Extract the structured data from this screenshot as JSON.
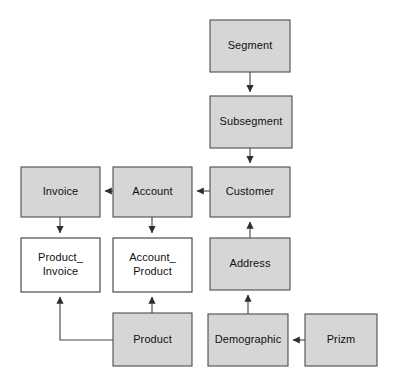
{
  "diagram": {
    "type": "er-diagram",
    "canvas": {
      "width": 400,
      "height": 388,
      "background": "#ffffff"
    },
    "styles": {
      "filled_fill": "#d6d6d6",
      "unfilled_fill": "#ffffff",
      "border_color": "#4d4d4d",
      "unfilled_border_color": "#3a3a3a",
      "edge_color": "#4a4a4a",
      "text_color": "#101010"
    },
    "nodes": [
      {
        "id": "segment",
        "label": "Segment",
        "lines": [
          "Segment"
        ],
        "x": 210,
        "y": 20,
        "w": 80,
        "h": 52,
        "fill": "filled"
      },
      {
        "id": "subsegment",
        "label": "Subsegment",
        "lines": [
          "Subsegment"
        ],
        "x": 210,
        "y": 96,
        "w": 82,
        "h": 52,
        "fill": "filled"
      },
      {
        "id": "customer",
        "label": "Customer",
        "lines": [
          "Customer"
        ],
        "x": 210,
        "y": 167,
        "w": 80,
        "h": 50,
        "fill": "filled"
      },
      {
        "id": "account",
        "label": "Account",
        "lines": [
          "Account"
        ],
        "x": 113,
        "y": 167,
        "w": 79,
        "h": 50,
        "fill": "filled"
      },
      {
        "id": "invoice",
        "label": "Invoice",
        "lines": [
          "Invoice"
        ],
        "x": 21,
        "y": 167,
        "w": 79,
        "h": 50,
        "fill": "filled"
      },
      {
        "id": "product_invoice",
        "label": "Product_Invoice",
        "lines": [
          "Product_",
          "Invoice"
        ],
        "x": 21,
        "y": 238,
        "w": 79,
        "h": 54,
        "fill": "unfilled"
      },
      {
        "id": "account_product",
        "label": "Account_Product",
        "lines": [
          "Account_",
          "Product"
        ],
        "x": 113,
        "y": 238,
        "w": 79,
        "h": 54,
        "fill": "unfilled"
      },
      {
        "id": "address",
        "label": "Address",
        "lines": [
          "Address"
        ],
        "x": 210,
        "y": 238,
        "w": 80,
        "h": 52,
        "fill": "filled"
      },
      {
        "id": "product",
        "label": "Product",
        "lines": [
          "Product"
        ],
        "x": 113,
        "y": 313,
        "w": 79,
        "h": 53,
        "fill": "filled"
      },
      {
        "id": "demographic",
        "label": "Demographic",
        "lines": [
          "Demographic"
        ],
        "x": 208,
        "y": 314,
        "w": 80,
        "h": 52,
        "fill": "filled"
      },
      {
        "id": "prizm",
        "label": "Prizm",
        "lines": [
          "Prizm"
        ],
        "x": 305,
        "y": 314,
        "w": 72,
        "h": 52,
        "fill": "filled"
      }
    ],
    "edges": [
      {
        "id": "segment-to-subsegment",
        "from": "segment",
        "to": "subsegment",
        "path": "M 250 72 L 250 92",
        "arrow": "down"
      },
      {
        "id": "subsegment-to-customer",
        "from": "subsegment",
        "to": "customer",
        "path": "M 250 148 L 250 163",
        "arrow": "down"
      },
      {
        "id": "customer-to-account",
        "from": "customer",
        "to": "account",
        "path": "M 210 191 L 197 191",
        "arrow": "left"
      },
      {
        "id": "account-to-invoice",
        "from": "account",
        "to": "invoice",
        "path": "M 113 191 L 105 191",
        "arrow": "left"
      },
      {
        "id": "invoice-to-product-invoice",
        "from": "invoice",
        "to": "product_invoice",
        "path": "M 60 217 L 60 233",
        "arrow": "down"
      },
      {
        "id": "account-to-account-product",
        "from": "account",
        "to": "account_product",
        "path": "M 152 217 L 152 233",
        "arrow": "down"
      },
      {
        "id": "address-to-customer",
        "from": "address",
        "to": "customer",
        "path": "M 250 238 L 250 222",
        "arrow": "up"
      },
      {
        "id": "demographic-to-address",
        "from": "demographic",
        "to": "address",
        "path": "M 248 314 L 248 295",
        "arrow": "up"
      },
      {
        "id": "prizm-to-demographic",
        "from": "prizm",
        "to": "demographic",
        "path": "M 305 340 L 293 340",
        "arrow": "left"
      },
      {
        "id": "product-to-account-product",
        "from": "product",
        "to": "account_product",
        "path": "M 152 313 L 152 297",
        "arrow": "up"
      },
      {
        "id": "product-to-product-invoice",
        "from": "product",
        "to": "product_invoice",
        "path": "M 113 340 L 60 340 L 60 297",
        "arrow": "up"
      }
    ]
  }
}
